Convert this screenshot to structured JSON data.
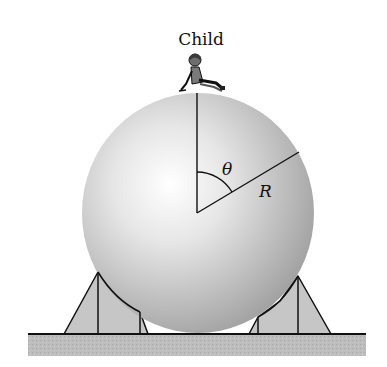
{
  "labels": {
    "child": "Child",
    "angle": "θ",
    "radius": "R"
  },
  "colors": {
    "sphere_light": "#ffffff",
    "sphere_dark": "#9a9a9a",
    "support": "#c8c8c8",
    "ground": "#b9b9b9",
    "line": "#111111"
  }
}
